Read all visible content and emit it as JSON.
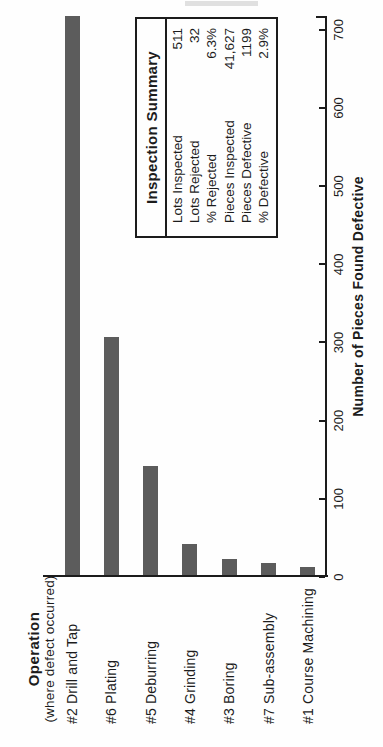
{
  "chart_data": {
    "type": "bar",
    "orientation": "horizontal",
    "rotated_90_ccw_on_page": true,
    "categories": [
      "#2 Drill and Tap",
      "#6 Plating",
      "#5 Deburring",
      "#4 Grinding",
      "#3 Boring",
      "#7 Sub-assembly",
      "#1 Course Machining"
    ],
    "values": [
      715,
      305,
      140,
      40,
      20,
      15,
      10
    ],
    "category_axis_title": "Operation",
    "category_axis_subtitle": "(where defect occurred)",
    "value_axis_title": "Number of Pieces Found Defective",
    "value_ticks": [
      0,
      100,
      200,
      300,
      400,
      500,
      600,
      700
    ],
    "value_axis_range": [
      0,
      715
    ],
    "grid": false,
    "legend": "none",
    "bar_color": "#5c5c5c",
    "ink_color": "#1c1c1c",
    "background_color": "#fefefe"
  },
  "summary_box": {
    "title": "Inspection Summary",
    "rows": [
      {
        "label": "Lots Inspected",
        "value": "511"
      },
      {
        "label": "Lots Rejected",
        "value": "32"
      },
      {
        "label": "% Rejected",
        "value": "6.3%"
      },
      {
        "label": "Pieces Inspected",
        "value": "41,627"
      },
      {
        "label": "Pieces Defective",
        "value": "1199"
      },
      {
        "label": "% Defective",
        "value": "2.9%"
      }
    ]
  }
}
